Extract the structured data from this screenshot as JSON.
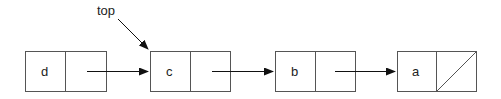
{
  "diagram": {
    "pointer_label": "top",
    "nodes": [
      {
        "value": "d",
        "next": "c",
        "is_null": false
      },
      {
        "value": "c",
        "next": "b",
        "is_null": false
      },
      {
        "value": "b",
        "next": "a",
        "is_null": false
      },
      {
        "value": "a",
        "next": null,
        "is_null": true
      }
    ],
    "pointer_target": "c",
    "colors": {
      "stroke": "#555555",
      "text": "#222222",
      "background": "#ffffff"
    }
  }
}
